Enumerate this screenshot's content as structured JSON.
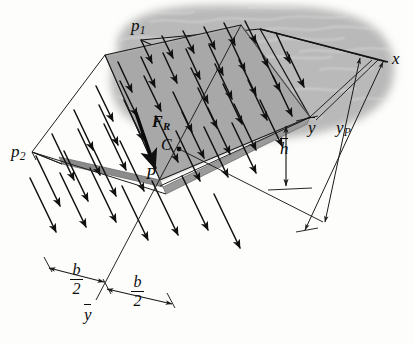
{
  "figure": {
    "type": "engineering-diagram",
    "background_color": "#fdfdfb",
    "plate_color": "#a8a8a8",
    "plate_edge_color": "#8e8e8e",
    "fluid_color": "#b4b4b4",
    "line_color": "#101010"
  },
  "labels": {
    "p1": {
      "text": "p",
      "sub": "1",
      "x": 131,
      "y": 22
    },
    "p2": {
      "text": "p",
      "sub": "2",
      "x": 13,
      "y": 145
    },
    "x_axis": {
      "text": "x",
      "x": 392,
      "y": 57
    },
    "FR": {
      "text": "F",
      "sub": "R",
      "x": 153,
      "y": 123
    },
    "C": {
      "text": "C",
      "x": 163,
      "y": 145
    },
    "P": {
      "text": "P",
      "x": 149,
      "y": 172
    },
    "h_bar": {
      "text": "h",
      "x": 283,
      "y": 147
    },
    "y_bar_right": {
      "text": "y",
      "x": 310,
      "y": 126
    },
    "yP": {
      "text": "y",
      "sub": "P",
      "x": 338,
      "y": 127
    },
    "y_bar_bottom": {
      "text": "y",
      "x": 86,
      "y": 313
    },
    "b_over_2_left": {
      "num": "b",
      "den": "2",
      "x": 75,
      "y": 272
    },
    "b_over_2_right": {
      "num": "b",
      "den": "2",
      "x": 136,
      "y": 283
    }
  },
  "geometry": {
    "plate_top_face": "105,55 241,25 310,117 160,180",
    "plate_thickness_px": 7,
    "pressure_arrow_count": 34,
    "fluid_blob_present": true
  }
}
